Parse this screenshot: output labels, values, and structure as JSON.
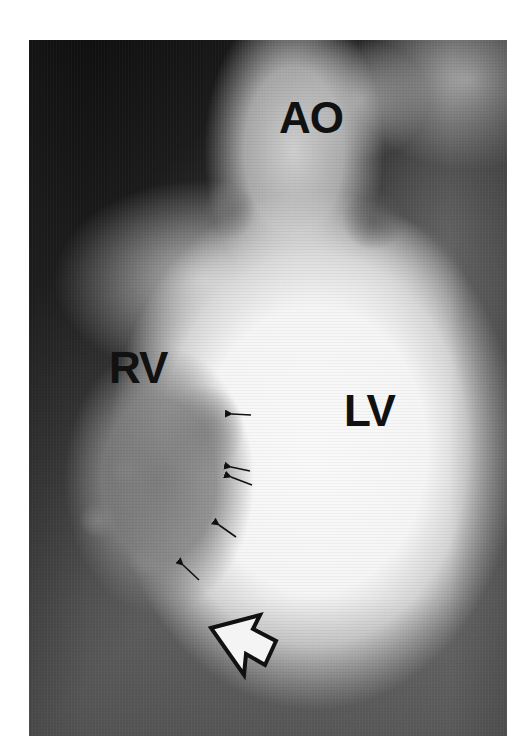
{
  "figure": {
    "type": "contrast ventriculogram",
    "background_color": "#ffffff",
    "tones": {
      "dark": "#0c0c0c",
      "mid": "#5c5c5c",
      "bright": "#f6f6f6",
      "label": "#111111"
    },
    "labels": [
      {
        "id": "ao",
        "text": "AO",
        "x": 279,
        "y": 99
      },
      {
        "id": "rv",
        "text": "RV",
        "x": 109,
        "y": 349
      },
      {
        "id": "lv",
        "text": "LV",
        "x": 344,
        "y": 392
      }
    ],
    "small_arrows": [
      {
        "tip": [
          232,
          414
        ],
        "tail": [
          251,
          415
        ]
      },
      {
        "tip": [
          231,
          467
        ],
        "tail": [
          250,
          471
        ]
      },
      {
        "tip": [
          231,
          477
        ],
        "tail": [
          252,
          485
        ]
      },
      {
        "tip": [
          219,
          525
        ],
        "tail": [
          236,
          537
        ]
      },
      {
        "tip": [
          183,
          565
        ],
        "tail": [
          199,
          580
        ]
      }
    ],
    "open_arrow": {
      "direction": "up-left",
      "points": "211,628 260,615 253,629 276,641 265,665 246,654 244,675"
    }
  }
}
